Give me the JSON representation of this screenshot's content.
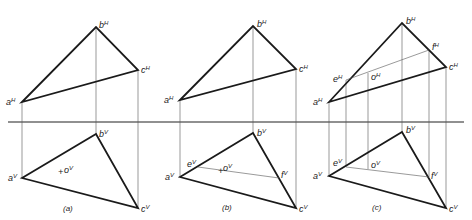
{
  "diagram": {
    "type": "descriptive-geometry-projections",
    "fold_line": {
      "y": 122,
      "x1": 8,
      "x2": 464,
      "label": ""
    },
    "panels": [
      {
        "caption": "(a)",
        "top_view": {
          "triangle": {
            "a": [
              22,
              102
            ],
            "b": [
              96,
              27
            ],
            "c": [
              138,
              70
            ]
          },
          "labels": {
            "a": "a",
            "b": "b",
            "c": "c",
            "sup": "H"
          }
        },
        "front_view": {
          "triangle": {
            "a": [
              22,
              178
            ],
            "b": [
              96,
              134
            ],
            "c": [
              138,
              208
            ]
          },
          "labels": {
            "a": "a",
            "b": "b",
            "c": "c",
            "o": "o",
            "sup": "V"
          },
          "point_o": [
            62,
            172
          ]
        }
      },
      {
        "caption": "(b)",
        "top_view": {
          "triangle": {
            "a": [
              180,
              100
            ],
            "b": [
              253,
              26
            ],
            "c": [
              296,
              69
            ]
          },
          "labels": {
            "a": "a",
            "b": "b",
            "c": "c",
            "sup": "H"
          }
        },
        "front_view": {
          "triangle": {
            "a": [
              180,
              177
            ],
            "b": [
              253,
              133
            ],
            "c": [
              296,
              208
            ]
          },
          "labels": {
            "a": "a",
            "b": "b",
            "c": "c",
            "e": "e",
            "f": "f",
            "o": "o",
            "sup": "V"
          },
          "line_ef": {
            "e": [
              198,
              167
            ],
            "f": [
              279,
              178
            ]
          },
          "point_o": [
            220,
            170
          ]
        }
      },
      {
        "caption": "(c)",
        "top_view": {
          "triangle": {
            "a": [
              329,
              102
            ],
            "b": [
              402,
              23
            ],
            "c": [
              446,
              67
            ]
          },
          "labels": {
            "a": "a",
            "b": "b",
            "c": "c",
            "e": "e",
            "f": "f",
            "o": "o",
            "sup": "H"
          },
          "line_ef": {
            "e": [
              346,
              80
            ],
            "f": [
              429,
              50
            ]
          },
          "point_o": [
            368,
            73
          ]
        },
        "front_view": {
          "triangle": {
            "a": [
              329,
              176
            ],
            "b": [
              402,
              132
            ],
            "c": [
              446,
              208
            ]
          },
          "labels": {
            "a": "a",
            "b": "b",
            "c": "c",
            "e": "e",
            "f": "f",
            "o": "o",
            "sup": "V"
          },
          "line_ef": {
            "e": [
              346,
              167
            ],
            "f": [
              429,
              177
            ]
          },
          "point_o": [
            368,
            169
          ]
        }
      }
    ]
  }
}
